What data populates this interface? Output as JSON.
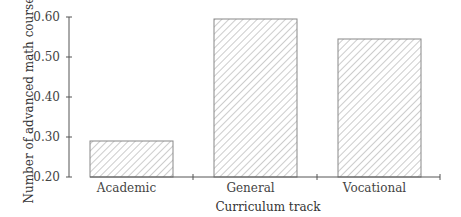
{
  "chart_data": {
    "type": "bar",
    "title": "",
    "xlabel": "Curriculum track",
    "ylabel": "Number of advanced math courses",
    "categories": [
      "Academic",
      "General",
      "Vocational"
    ],
    "values": [
      0.29,
      0.595,
      0.545
    ],
    "ylim": [
      0.2,
      0.6
    ],
    "yticks": [
      "0.20",
      "0.30",
      "0.40",
      "0.50",
      "0.60"
    ],
    "grid": false,
    "legend": null,
    "bar_fill": "diagonal-hatch"
  },
  "colors": {
    "axis": "#555555",
    "bar_stroke": "#888888",
    "hatch": "#999999"
  }
}
